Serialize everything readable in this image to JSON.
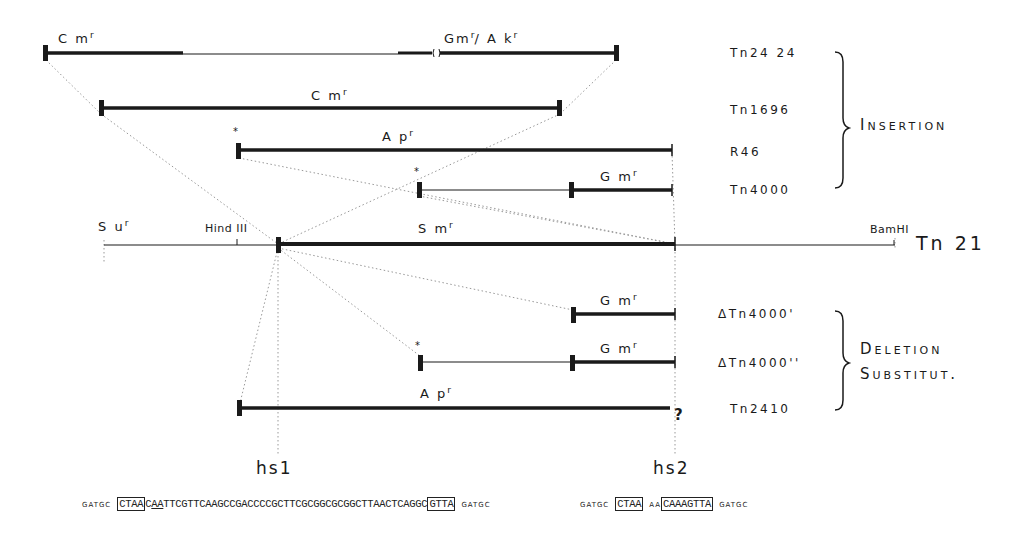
{
  "figure": {
    "main_element": {
      "name": "Tn 21",
      "resistance": "Sm",
      "sites": [
        "Su",
        "Hind III",
        "BamHI"
      ],
      "su_label": "S u",
      "sm_label": "S m"
    },
    "groups": [
      {
        "label": "Insertion",
        "members": [
          "Tn24 24",
          "Tn1696",
          "R46",
          "Tn4000"
        ]
      },
      {
        "label_line1": "Deletion",
        "label_line2": "Substitut."
      }
    ],
    "rows": [
      {
        "name": "Tn24 24",
        "labels": [
          "C m",
          "Gm/A k"
        ],
        "superscript": "r"
      },
      {
        "name": "Tn1696",
        "labels": [
          "C m"
        ],
        "superscript": "r"
      },
      {
        "name": "R46",
        "labels": [
          "A p"
        ],
        "superscript": "r",
        "star": "*"
      },
      {
        "name": "Tn4000",
        "labels": [
          "G m"
        ],
        "superscript": "r",
        "star": "*"
      },
      {
        "name": "ΔTn4000'",
        "labels": [
          "G m"
        ],
        "superscript": "r"
      },
      {
        "name": "ΔTn4000''",
        "labels": [
          "G m"
        ],
        "superscript": "r",
        "star": "*"
      },
      {
        "name": "Tn2410",
        "labels": [
          "A p"
        ],
        "superscript": "r",
        "trailing": "?"
      }
    ],
    "hotspots": [
      "hs1",
      "hs2"
    ],
    "sequences": {
      "hs1": {
        "prefix": "GATGC",
        "box1": "CTAA",
        "mid1": "C",
        "under": "AA",
        "body": "TTCGTTCAAGCCGACCCCGCTTCGCGGCGCGGCTTAACTCAGGC",
        "box2": "GTTA",
        "suffix": "GATGC"
      },
      "hs2": {
        "prefix": "GATGC",
        "box1": "CTAA",
        "mid": "AA",
        "box2": "CAAAGTTA",
        "suffix": "GATGC"
      }
    }
  },
  "text": {
    "r": "r",
    "star": "*",
    "cm": "C m",
    "gmak_gm": "Gm",
    "gmak_ak": "/ A k",
    "ap": "A p",
    "gm": "G m",
    "sm": "S m",
    "su": "S u",
    "hind": "Hind III",
    "bam": "BamHI",
    "tn21": "Tn 21",
    "n_tn2424": "Tn24 24",
    "n_tn1696": "Tn1696",
    "n_r46": "R46",
    "n_tn4000": "Tn4000",
    "n_d1": "ΔTn4000'",
    "n_d2": "ΔTn4000''",
    "n_tn2410": "Tn2410",
    "insertion": "Insertion",
    "deletion": "Deletion",
    "substitut": "Substitut.",
    "hs1": "hs1",
    "hs2": "hs2",
    "q": "?",
    "seq1_prefix": "GATGC",
    "seq1_box1": "CTAA",
    "seq1_c": "C",
    "seq1_aa": "AA",
    "seq1_body": "TTCGTTCAAGCCGACCCCGCTTCGCGGCGCGGCTTAACTCAGGC",
    "seq1_box2": "GTTA",
    "seq1_suffix": "GATGC",
    "seq2_prefix": "GATGC",
    "seq2_box1": "CTAA",
    "seq2_mid": "AA",
    "seq2_box2": "CAAAGTTA",
    "seq2_suffix": "GATGC"
  }
}
